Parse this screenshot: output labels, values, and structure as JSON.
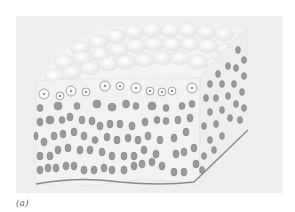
{
  "figure": {
    "caption": "(a)",
    "colors": {
      "panel_background": "#efefef",
      "surface_cells": "#f7f7f7",
      "cell_outline": "#d2d2d2",
      "nucleus_fill": "#9a9a9a",
      "nucleus_outline": "#7d7d7d",
      "basement_membrane": "#8a8a8a"
    }
  }
}
